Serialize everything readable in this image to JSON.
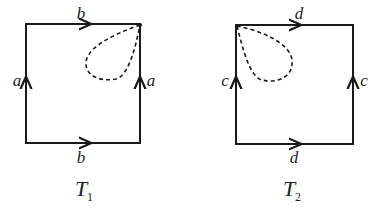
{
  "diagrams": [
    {
      "name": "T",
      "subscript": "1",
      "edges": {
        "top": "b",
        "bottom": "b",
        "left": "a",
        "right": "a"
      },
      "loop_corner": "top-right"
    },
    {
      "name": "T",
      "subscript": "2",
      "edges": {
        "top": "d",
        "bottom": "d",
        "left": "c",
        "right": "c"
      },
      "loop_corner": "top-left"
    }
  ],
  "colors": {
    "stroke": "#1a1a1a",
    "background": "#ffffff"
  }
}
